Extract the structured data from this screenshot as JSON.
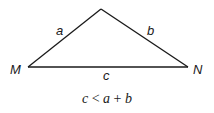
{
  "figure": {
    "type": "triangle-inequality",
    "vertices": {
      "M": {
        "label": "M",
        "x": 28,
        "y": 67
      },
      "N": {
        "label": "N",
        "x": 188,
        "y": 67
      },
      "apex": {
        "label": "",
        "x": 101,
        "y": 9
      }
    },
    "sides": {
      "a": {
        "label": "a"
      },
      "b": {
        "label": "b"
      },
      "c": {
        "label": "c"
      }
    },
    "line_color": "#1a1a1a",
    "formula": {
      "c": "c",
      "lt": "<",
      "a": "a",
      "plus": "+",
      "b": "b"
    }
  }
}
